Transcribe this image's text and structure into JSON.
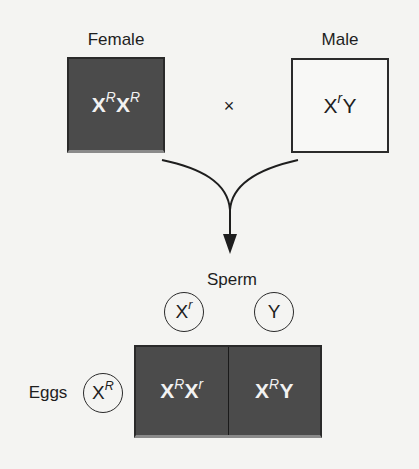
{
  "parents": {
    "female": {
      "label": "Female",
      "genotype": {
        "base1": "X",
        "sup1": "R",
        "base2": "X",
        "sup2": "R"
      },
      "fill": "#4b4b4b"
    },
    "cross_symbol": "×",
    "male": {
      "label": "Male",
      "genotype": {
        "base1": "X",
        "sup1": "r",
        "base2": "Y"
      },
      "fill": "#f8f8f6"
    }
  },
  "arrow": {
    "icon": "merge-arrow-down-icon"
  },
  "gametes": {
    "sperm": {
      "label": "Sperm",
      "items": [
        {
          "base": "X",
          "sup": "r"
        },
        {
          "base": "Y",
          "sup": ""
        }
      ]
    },
    "eggs": {
      "label": "Eggs",
      "items": [
        {
          "base": "X",
          "sup": "R"
        }
      ]
    }
  },
  "offspring": {
    "cells": [
      {
        "base1": "X",
        "sup1": "R",
        "base2": "X",
        "sup2": "r"
      },
      {
        "base1": "X",
        "sup1": "R",
        "base2": "Y",
        "sup2": ""
      }
    ],
    "fill": "#4b4b4b"
  }
}
